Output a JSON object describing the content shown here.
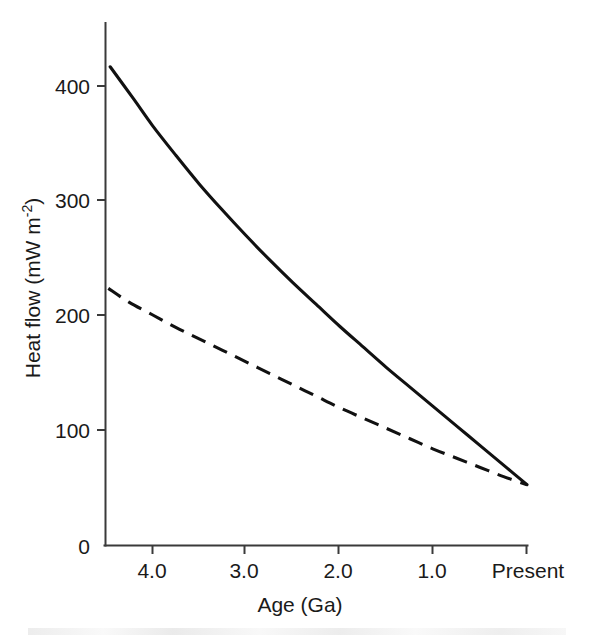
{
  "chart_data": {
    "type": "line",
    "title": "",
    "xlabel": "Age (Ga)",
    "ylabel": "Heat flow (mW m",
    "ylabel_superscript": "-2",
    "ylabel_suffix": ")",
    "xlim": [
      4.5,
      0
    ],
    "ylim": [
      0,
      455
    ],
    "x_reversed": true,
    "grid": false,
    "legend": "none",
    "x_ticks": [
      {
        "value": 4.0,
        "label": "4.0"
      },
      {
        "value": 3.0,
        "label": "3.0"
      },
      {
        "value": 2.0,
        "label": "2.0"
      },
      {
        "value": 1.0,
        "label": "1.0"
      },
      {
        "value": 0.0,
        "label": "Present"
      }
    ],
    "y_ticks": [
      {
        "value": 0,
        "label": "0"
      },
      {
        "value": 100,
        "label": "100"
      },
      {
        "value": 200,
        "label": "200"
      },
      {
        "value": 300,
        "label": "300"
      },
      {
        "value": 400,
        "label": "400"
      }
    ],
    "series": [
      {
        "name": "upper-heat-flow-curve",
        "style": "solid",
        "color": "#111111",
        "x": [
          4.45,
          4.2,
          4.0,
          3.75,
          3.5,
          3.25,
          3.0,
          2.75,
          2.5,
          2.25,
          2.0,
          1.75,
          1.5,
          1.25,
          1.0,
          0.75,
          0.5,
          0.25,
          0.0
        ],
        "y": [
          417,
          389,
          366,
          340,
          315,
          292,
          270,
          249,
          229,
          210,
          191,
          173,
          155,
          138,
          121,
          104,
          87,
          70,
          53
        ]
      },
      {
        "name": "lower-heat-flow-curve",
        "style": "dashed",
        "color": "#111111",
        "x": [
          4.47,
          4.25,
          4.0,
          3.75,
          3.5,
          3.25,
          3.0,
          2.75,
          2.5,
          2.25,
          2.0,
          1.75,
          1.5,
          1.25,
          1.0,
          0.75,
          0.5,
          0.25,
          0.0
        ],
        "y": [
          224,
          212,
          201,
          190,
          180,
          170,
          160,
          150,
          140,
          130,
          120,
          111,
          102,
          93,
          84,
          76,
          68,
          60,
          53
        ]
      }
    ]
  },
  "labels": {
    "y_axis_title_part1": "Heat flow (mW m",
    "y_axis_title_sup": "-2",
    "y_axis_title_part2": ")",
    "x_axis_title": "Age (Ga)"
  }
}
